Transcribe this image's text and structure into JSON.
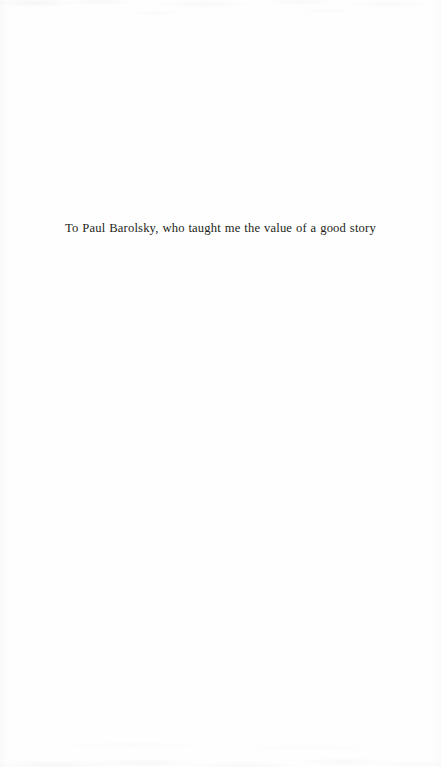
{
  "page": {
    "kind": "book-dedication-page",
    "background_color": "#fefefe",
    "width": 441,
    "height": 767
  },
  "dedication": {
    "text": "To Paul Barolsky, who taught me the value of a good story",
    "text_color": "#231f20",
    "alignment": "center"
  }
}
